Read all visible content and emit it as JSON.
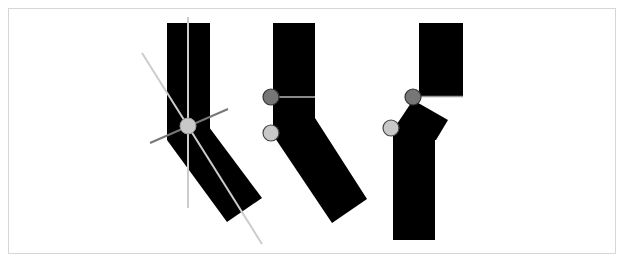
{
  "diagram": {
    "title": "",
    "colors": {
      "background": "#ffffff",
      "frame": "#d6d6d6",
      "segment": "#000000",
      "axis_light": "#cccccc",
      "axis_dark": "#777777",
      "joint_dark_fill": "#767676",
      "joint_light_fill": "#c8c8c8",
      "joint_stroke": "#333333"
    },
    "figures": [
      {
        "id": "figure-1",
        "description": "bent bar with joint axes (vertical, diagonal and perpendicular lines through single pivot)",
        "pivot": {
          "cx": 188,
          "cy": 126,
          "r": 8,
          "style": "light"
        }
      },
      {
        "id": "figure-2",
        "description": "bent bar with two pivots on left edge and horizontal seam line",
        "pivots": [
          {
            "cx": 271,
            "cy": 97,
            "r": 8,
            "style": "dark"
          },
          {
            "cx": 271,
            "cy": 133,
            "r": 8,
            "style": "light"
          }
        ]
      },
      {
        "id": "figure-3",
        "description": "separated upper block and lower bar with rotated cap, two pivots",
        "pivots": [
          {
            "cx": 413,
            "cy": 97,
            "r": 8,
            "style": "dark"
          },
          {
            "cx": 391,
            "cy": 128,
            "r": 8,
            "style": "light"
          }
        ]
      }
    ]
  }
}
